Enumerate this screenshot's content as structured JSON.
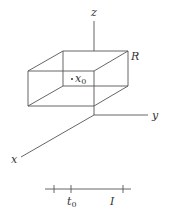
{
  "figure": {
    "axes": {
      "z_label": "z",
      "y_label": "y",
      "x_label": "x"
    },
    "region_label": "R",
    "point_label": {
      "base": "x",
      "sub": "0"
    },
    "timeline": {
      "t0_label": {
        "base": "t",
        "sub": "0"
      },
      "interval_label": "I"
    },
    "colors": {
      "line": "#555555",
      "text": "#333333",
      "background": "#ffffff"
    }
  }
}
